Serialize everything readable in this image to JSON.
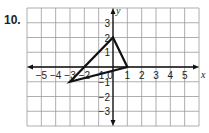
{
  "problem": {
    "number": "10."
  },
  "chart_data": {
    "type": "scatter",
    "title": "",
    "xlabel": "x",
    "ylabel": "y",
    "xlim": [
      -6,
      6
    ],
    "ylim": [
      -4,
      4
    ],
    "grid": true,
    "x_ticks": [
      -5,
      -4,
      -3,
      -2,
      -1,
      0,
      1,
      2,
      3,
      4,
      5
    ],
    "y_ticks": [
      3,
      2,
      1,
      -1,
      -2,
      -3
    ],
    "x_tick_labels": [
      "−5",
      "−4",
      "−3",
      "−2",
      "−1",
      "0",
      "1",
      "2",
      "3",
      "4",
      "5"
    ],
    "y_tick_labels": [
      "3",
      "2",
      "1",
      "−1",
      "−2",
      "−3"
    ],
    "series": [
      {
        "name": "triangle",
        "shape": "polygon",
        "points": [
          {
            "x": 0,
            "y": 2
          },
          {
            "x": 1,
            "y": 0
          },
          {
            "x": -3,
            "y": -1
          }
        ]
      }
    ],
    "colors": {
      "grid": "#9a9a9a",
      "axis": "#111111",
      "shape": "#111111"
    }
  }
}
